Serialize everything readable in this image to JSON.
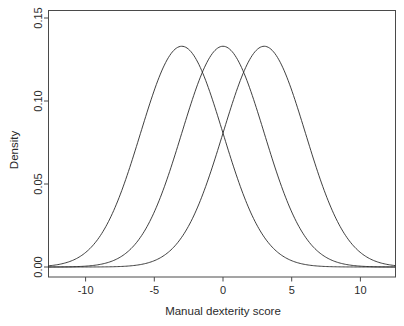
{
  "chart_data": {
    "type": "line",
    "title": "",
    "subtitle": "",
    "xlabel": "Manual dexterity score",
    "ylabel": "Density",
    "xlim": [
      -12.7,
      12.5
    ],
    "ylim": [
      0.0,
      0.15
    ],
    "xticks": [
      -10,
      -5,
      0,
      5,
      10
    ],
    "xtick_labels": [
      "-10",
      "-5",
      "0",
      "5",
      "10"
    ],
    "yticks": [
      0.0,
      0.05,
      0.1,
      0.15
    ],
    "ytick_labels": [
      "0.00",
      "0.05",
      "0.10",
      "0.15"
    ],
    "grid": false,
    "legend": "none",
    "frame": "box",
    "curve_color": "#2a2a2a",
    "axis_color": "#4a4a4a",
    "background": "#ffffff",
    "series": [
      {
        "name": "Group 1",
        "distribution": "normal",
        "mean": -3,
        "sd": 3,
        "peak_density": 0.133,
        "x": [
          -12.7,
          -11,
          -9,
          -7,
          -6,
          -5,
          -4,
          -3,
          -2,
          -1,
          0,
          1,
          3,
          5,
          7,
          9,
          11,
          12.5
        ],
        "values": [
          0.0008,
          0.0028,
          0.0115,
          0.0298,
          0.0403,
          0.0484,
          0.0527,
          0.0532,
          0.0527,
          0.0484,
          0.0403,
          0.0298,
          0.0115,
          0.0028,
          0.0004,
          3e-05,
          1e-06,
          1e-07
        ]
      },
      {
        "name": "Group 2",
        "distribution": "normal",
        "mean": 0,
        "sd": 3,
        "peak_density": 0.133,
        "x": [
          -12.5,
          -11,
          -9,
          -7,
          -6,
          -5,
          -4,
          -3,
          -2,
          -1,
          0,
          1,
          2,
          3,
          4,
          5,
          6,
          7,
          9,
          11,
          12.5
        ],
        "values": [
          1e-05,
          0.0001,
          0.0005,
          0.0028,
          0.0054,
          0.0096,
          0.016,
          0.0242,
          0.0332,
          0.0418,
          0.0484,
          0.0418,
          0.0332,
          0.0242,
          0.016,
          0.0096,
          0.0054,
          0.0028,
          0.0005,
          0.0001,
          1e-05
        ]
      },
      {
        "name": "Group 3",
        "distribution": "normal",
        "mean": 3,
        "sd": 3,
        "peak_density": 0.133,
        "x": [
          -12.7,
          -11,
          -9,
          -7,
          -5,
          -3,
          -1,
          0,
          1,
          2,
          3,
          4,
          5,
          6,
          7,
          9,
          11,
          12.5
        ],
        "values": [
          1e-07,
          1e-06,
          3e-05,
          0.0004,
          0.0028,
          0.0115,
          0.0298,
          0.0403,
          0.0484,
          0.0527,
          0.0532,
          0.0527,
          0.0484,
          0.0403,
          0.0298,
          0.0115,
          0.0028,
          0.0008
        ]
      }
    ],
    "note_peak_value": "0.133"
  },
  "axes": {
    "x_title": "Manual dexterity score",
    "y_title": "Density",
    "x_tick_labels": [
      "-10",
      "-5",
      "0",
      "5",
      "10"
    ],
    "y_tick_labels": [
      "0.00",
      "0.05",
      "0.10",
      "0.15"
    ]
  }
}
